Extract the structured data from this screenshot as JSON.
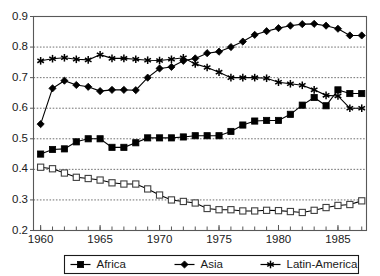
{
  "chart_data": {
    "type": "line",
    "title": "",
    "xlabel": "",
    "ylabel": "",
    "xlim": [
      1959.4,
      1987.4
    ],
    "ylim": [
      0.2,
      0.9
    ],
    "grid": true,
    "grid_axis": "y",
    "legend_position": "bottom-outside",
    "x_tick_labels": [
      "1960",
      "1965",
      "1970",
      "1975",
      "1980",
      "1985"
    ],
    "x_tick_values": [
      1960,
      1965,
      1970,
      1975,
      1980,
      1985
    ],
    "x_minor_ticks_every": 1,
    "y_tick_labels": [
      "0.2",
      "0.3",
      "0.4",
      "0.5",
      "0.6",
      "0.7",
      "0.8",
      "0.9"
    ],
    "y_tick_values": [
      0.2,
      0.3,
      0.4,
      0.5,
      0.6,
      0.7,
      0.8,
      0.9
    ],
    "x": [
      1960,
      1961,
      1962,
      1963,
      1964,
      1965,
      1966,
      1967,
      1968,
      1969,
      1970,
      1971,
      1972,
      1973,
      1974,
      1975,
      1976,
      1977,
      1978,
      1979,
      1980,
      1981,
      1982,
      1983,
      1984,
      1985,
      1986,
      1987
    ],
    "series": [
      {
        "name": "Africa",
        "marker": "filled-square",
        "color": "#000000",
        "values": [
          0.45,
          0.465,
          0.467,
          0.49,
          0.5,
          0.5,
          0.472,
          0.472,
          0.487,
          0.503,
          0.503,
          0.503,
          0.506,
          0.51,
          0.51,
          0.51,
          0.524,
          0.545,
          0.558,
          0.56,
          0.56,
          0.58,
          0.61,
          0.635,
          0.608,
          0.66,
          0.648,
          0.648
        ]
      },
      {
        "name": "Asia",
        "marker": "filled-diamond",
        "color": "#000000",
        "values": [
          0.548,
          0.665,
          0.69,
          0.676,
          0.67,
          0.656,
          0.66,
          0.66,
          0.659,
          0.7,
          0.73,
          0.735,
          0.755,
          0.763,
          0.78,
          0.785,
          0.8,
          0.818,
          0.84,
          0.852,
          0.862,
          0.87,
          0.875,
          0.876,
          0.87,
          0.86,
          0.838,
          0.838
        ]
      },
      {
        "name": "Latin-America",
        "marker": "star",
        "color": "#000000",
        "values": [
          0.755,
          0.762,
          0.765,
          0.76,
          0.758,
          0.775,
          0.763,
          0.763,
          0.76,
          0.757,
          0.756,
          0.76,
          0.765,
          0.745,
          0.733,
          0.718,
          0.7,
          0.7,
          0.7,
          0.698,
          0.685,
          0.68,
          0.675,
          0.66,
          0.642,
          0.64,
          0.6,
          0.6
        ]
      },
      {
        "name": "",
        "marker": "open-square",
        "color": "#404040",
        "values": [
          0.407,
          0.402,
          0.388,
          0.374,
          0.37,
          0.365,
          0.356,
          0.352,
          0.352,
          0.336,
          0.316,
          0.3,
          0.295,
          0.29,
          0.272,
          0.268,
          0.268,
          0.264,
          0.264,
          0.266,
          0.265,
          0.262,
          0.259,
          0.266,
          0.275,
          0.282,
          0.285,
          0.297
        ]
      }
    ],
    "unlabeled_series_count": 1
  },
  "legend": {
    "entries": [
      {
        "label": "Africa",
        "marker": "filled-square"
      },
      {
        "label": "Asia",
        "marker": "filled-diamond"
      },
      {
        "label": "Latin-America",
        "marker": "star"
      }
    ]
  }
}
